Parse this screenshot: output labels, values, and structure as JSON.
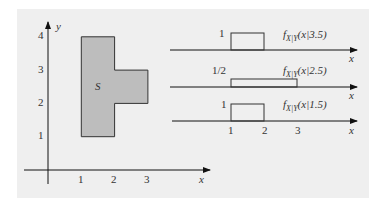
{
  "left_plot": {
    "axis_x_label": "x",
    "axis_y_label": "y",
    "x_ticks": [
      "1",
      "2",
      "3"
    ],
    "y_ticks": [
      "1",
      "2",
      "3",
      "4"
    ],
    "region_label": "S",
    "region_fill": "#bdbdbd",
    "region_vertices": [
      [
        1,
        1
      ],
      [
        2,
        1
      ],
      [
        2,
        2
      ],
      [
        3,
        2
      ],
      [
        3,
        3
      ],
      [
        2,
        3
      ],
      [
        2,
        4
      ],
      [
        1,
        4
      ]
    ]
  },
  "right_plots": [
    {
      "label_main": "f",
      "label_sub": "X|Y",
      "label_arg": "(x|3.5)",
      "height_label": "1",
      "interval": [
        1,
        2
      ],
      "axis_label": "x"
    },
    {
      "label_main": "f",
      "label_sub": "X|Y",
      "label_arg": "(x|2.5)",
      "height_label": "1/2",
      "interval": [
        1,
        3
      ],
      "axis_label": "x"
    },
    {
      "label_main": "f",
      "label_sub": "X|Y",
      "label_arg": "(x|1.5)",
      "height_label": "1",
      "interval": [
        1,
        2
      ],
      "axis_label": "x"
    }
  ],
  "right_x_ticks": [
    "1",
    "2",
    "3"
  ]
}
